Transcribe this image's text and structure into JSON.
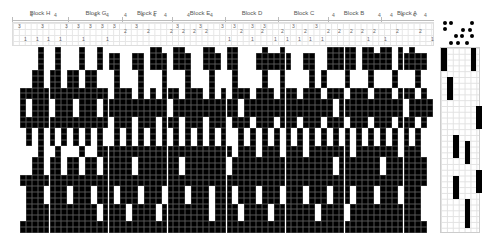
{
  "blocks": [
    {
      "label": "Block H",
      "x": 40
    },
    {
      "label": "Block G",
      "x": 96
    },
    {
      "label": "Block F",
      "x": 147
    },
    {
      "label": "Block E",
      "x": 200
    },
    {
      "label": "Block D",
      "x": 252
    },
    {
      "label": "Block C",
      "x": 304
    },
    {
      "label": "Block B",
      "x": 354
    },
    {
      "label": "Block A",
      "x": 407
    }
  ],
  "threading_numbers": [
    {
      "t": "4",
      "x": 30,
      "y": 16
    },
    {
      "t": "4",
      "x": 54,
      "y": 16
    },
    {
      "t": "3",
      "x": 18,
      "y": 27
    },
    {
      "t": "3",
      "x": 41,
      "y": 27
    },
    {
      "t": "1",
      "x": 24,
      "y": 40
    },
    {
      "t": "1",
      "x": 36,
      "y": 40
    },
    {
      "t": "1",
      "x": 47,
      "y": 40
    },
    {
      "t": "1",
      "x": 59,
      "y": 40
    },
    {
      "t": "4",
      "x": 94,
      "y": 16
    },
    {
      "t": "4",
      "x": 106,
      "y": 16
    },
    {
      "t": "3",
      "x": 65,
      "y": 27
    },
    {
      "t": "3",
      "x": 77,
      "y": 27
    },
    {
      "t": "3",
      "x": 89,
      "y": 27
    },
    {
      "t": "3",
      "x": 101,
      "y": 27
    },
    {
      "t": "1",
      "x": 82,
      "y": 40
    },
    {
      "t": "1",
      "x": 106,
      "y": 40
    },
    {
      "t": "4",
      "x": 124,
      "y": 16
    },
    {
      "t": "4",
      "x": 141,
      "y": 16
    },
    {
      "t": "4",
      "x": 153,
      "y": 16
    },
    {
      "t": "3",
      "x": 113,
      "y": 27
    },
    {
      "t": "2",
      "x": 124,
      "y": 32
    },
    {
      "t": "3",
      "x": 135,
      "y": 27
    },
    {
      "t": "2",
      "x": 147,
      "y": 32
    },
    {
      "t": "4",
      "x": 164,
      "y": 16
    },
    {
      "t": "4",
      "x": 187,
      "y": 16
    },
    {
      "t": "4",
      "x": 210,
      "y": 16
    },
    {
      "t": "3",
      "x": 176,
      "y": 27
    },
    {
      "t": "2",
      "x": 170,
      "y": 32
    },
    {
      "t": "2",
      "x": 182,
      "y": 32
    },
    {
      "t": "3",
      "x": 199,
      "y": 27
    },
    {
      "t": "2",
      "x": 193,
      "y": 32
    },
    {
      "t": "2",
      "x": 205,
      "y": 32
    },
    {
      "t": "3",
      "x": 221,
      "y": 27
    },
    {
      "t": "3",
      "x": 233,
      "y": 27
    },
    {
      "t": "3",
      "x": 251,
      "y": 27
    },
    {
      "t": "3",
      "x": 263,
      "y": 27
    },
    {
      "t": "2",
      "x": 240,
      "y": 32
    },
    {
      "t": "2",
      "x": 261,
      "y": 32
    },
    {
      "t": "1",
      "x": 228,
      "y": 40
    },
    {
      "t": "1",
      "x": 251,
      "y": 40
    },
    {
      "t": "2",
      "x": 281,
      "y": 32
    },
    {
      "t": "3",
      "x": 292,
      "y": 27
    },
    {
      "t": "2",
      "x": 304,
      "y": 32
    },
    {
      "t": "3",
      "x": 315,
      "y": 27
    },
    {
      "t": "1",
      "x": 274,
      "y": 40
    },
    {
      "t": "1",
      "x": 286,
      "y": 40
    },
    {
      "t": "1",
      "x": 298,
      "y": 40
    },
    {
      "t": "1",
      "x": 309,
      "y": 40
    },
    {
      "t": "4",
      "x": 332,
      "y": 16
    },
    {
      "t": "4",
      "x": 378,
      "y": 16
    },
    {
      "t": "2",
      "x": 327,
      "y": 32
    },
    {
      "t": "2",
      "x": 338,
      "y": 32
    },
    {
      "t": "2",
      "x": 350,
      "y": 32
    },
    {
      "t": "2",
      "x": 361,
      "y": 32
    },
    {
      "t": "2",
      "x": 373,
      "y": 32
    },
    {
      "t": "1",
      "x": 321,
      "y": 40
    },
    {
      "t": "1",
      "x": 367,
      "y": 40
    },
    {
      "t": "4",
      "x": 390,
      "y": 16
    },
    {
      "t": "4",
      "x": 401,
      "y": 16
    },
    {
      "t": "4",
      "x": 413,
      "y": 16
    },
    {
      "t": "4",
      "x": 424,
      "y": 16
    },
    {
      "t": "2",
      "x": 396,
      "y": 32
    },
    {
      "t": "2",
      "x": 419,
      "y": 32
    },
    {
      "t": "1",
      "x": 384,
      "y": 40
    },
    {
      "t": "1",
      "x": 431,
      "y": 40
    }
  ],
  "turning_dots": [
    [
      3,
      5
    ],
    [
      9,
      5
    ],
    [
      30,
      5
    ],
    [
      3,
      11
    ],
    [
      21,
      12
    ],
    [
      28,
      12
    ],
    [
      14,
      18
    ],
    [
      20,
      18
    ],
    [
      30,
      18
    ],
    [
      9,
      25
    ],
    [
      16,
      25
    ],
    [
      25,
      25
    ]
  ],
  "grid": {
    "cols": 70,
    "rows": 32,
    "cell_w": 5.9,
    "cell_h": 5.8,
    "rows_data": [
      "0001001000100100000000110011000110011000010010000000111110110110101000",
      "0001001000100101100110111011100111011000111111001100111110111110111110",
      "0001001000100101100110111011100111011000111111001100111110111110111110",
      "0001001000100101100110111011100111011000111111001100111110111110111110",
      "0011011011011000100010001000100010001000010010000101000100010001000100",
      "0011011011011000100010001000100010001000010010000101000100010001000100",
      "0011011011011000100010001000100010001000010010000101000100010001000100",
      "1111111111111110111010101110111010101110111011101110111011101110111010",
      "1111111111111110111010101110111010101110111011101110111011101110111010",
      "1011101110111011111111111011111111111011111111111111101111111111101111",
      "1011101110111011111111111011111111111011111111111111101111111111101111",
      "1011101110111011111111111011111111111011111111111111101111111111101111",
      "1111111111111110111011101110111011101110111011101110111011101110111010",
      "1111111111111110111011101110111011101110111011101110111011101110111010",
      "0101010101010100101010101010101010100101010101010101010101010101010100",
      "0101010101010100101010101010101010100101010101010101010101010101010100",
      "0101010101010100101010101010101010100101010101010101010101010101010100",
      "0001001000100111111111111111111111110111011101110111111101111111011100",
      "0001001000100111111111111111111111110111011101110111111101111111011100",
      "0011011011011011111011111110111111101111111111111111101111111011111110",
      "0011011011011011111011111110111111101111111111111111101111111011111110",
      "0011011011011011111011111110111111101111111111111111101111111011111110",
      "1111111111111111111111111111111111111111111111111111111111111111111110",
      "1111111111111111111111111111111111111111111111111111111111111111111110",
      "0111011101110111011101110111011101110111011101110111011101110111011100",
      "0111011101110111011101110111011101110111011101110111011101110111011100",
      "0111011101110111011101110111011101110111011101110111011101110111011100",
      "0111111111111011110111101111111101111011110111111101111011111111111100",
      "0111111111111011110111101111111101111011110111111101111011111111111100",
      "0111111111111011110111101111111101111011110111111101111011111111111100",
      "1111111111111111111111111111111111111111111111111111111111111111111110",
      "1111111111111111111111111111111111111111111111111111111111111111111110"
    ]
  },
  "side_marks": [
    {
      "col": 0,
      "row": 0,
      "h": 4
    },
    {
      "col": 5,
      "row": 0,
      "h": 4
    },
    {
      "col": 1,
      "row": 5,
      "h": 4
    },
    {
      "col": 6,
      "row": 10,
      "h": 4
    },
    {
      "col": 2,
      "row": 15,
      "h": 4
    },
    {
      "col": 4,
      "row": 16,
      "h": 4
    },
    {
      "col": 2,
      "row": 22,
      "h": 4
    },
    {
      "col": 6,
      "row": 21,
      "h": 4
    },
    {
      "col": 4,
      "row": 26,
      "h": 5
    }
  ]
}
